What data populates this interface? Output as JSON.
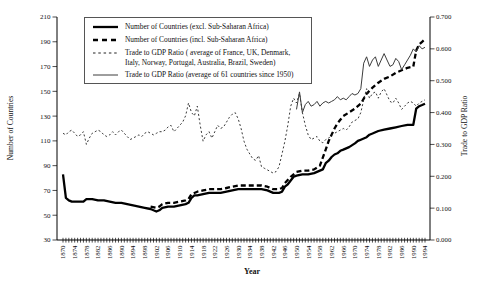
{
  "figure": {
    "kind": "dual-axis line chart",
    "background": "#ffffff",
    "line_color": "#000000"
  },
  "chart_data": {
    "type": "line",
    "title": "",
    "xlabel": "Year",
    "ylabel_left": "Number of Countries",
    "ylabel_right": "Trade to GDP Ratio",
    "grid": false,
    "legend_position": "top-left-inside",
    "x_range": [
      1870,
      1994
    ],
    "ylim_left": [
      30,
      210
    ],
    "ylim_right": [
      0.0,
      0.7
    ],
    "y_ticks_left": [
      30,
      50,
      70,
      90,
      110,
      130,
      150,
      170,
      190,
      210
    ],
    "y_ticks_right": [
      "0.000",
      "0.100",
      "0.200",
      "0.300",
      "0.400",
      "0.500",
      "0.600",
      "0.700"
    ],
    "x_ticks": [
      1870,
      1874,
      1878,
      1882,
      1886,
      1890,
      1894,
      1898,
      1902,
      1906,
      1910,
      1914,
      1918,
      1922,
      1926,
      1930,
      1934,
      1938,
      1942,
      1946,
      1950,
      1954,
      1958,
      1962,
      1966,
      1970,
      1974,
      1978,
      1982,
      1986,
      1990,
      1994
    ],
    "x_minor_tick_step": 1,
    "series": [
      {
        "id": "countries-excl-ssa",
        "name": "Number of Countries (excl. Sub-Saharan Africa)",
        "axis": "left",
        "style": "thick-solid",
        "color": "#000000",
        "points": [
          [
            1870,
            83
          ],
          [
            1871,
            64
          ],
          [
            1872,
            62
          ],
          [
            1873,
            61
          ],
          [
            1875,
            61
          ],
          [
            1877,
            61
          ],
          [
            1878,
            63
          ],
          [
            1880,
            63
          ],
          [
            1882,
            62
          ],
          [
            1884,
            62
          ],
          [
            1886,
            61
          ],
          [
            1888,
            60
          ],
          [
            1890,
            60
          ],
          [
            1892,
            59
          ],
          [
            1894,
            58
          ],
          [
            1896,
            57
          ],
          [
            1898,
            56
          ],
          [
            1900,
            55
          ],
          [
            1901,
            54
          ],
          [
            1902,
            53
          ],
          [
            1903,
            54
          ],
          [
            1904,
            56
          ],
          [
            1906,
            57
          ],
          [
            1908,
            57
          ],
          [
            1910,
            58
          ],
          [
            1912,
            59
          ],
          [
            1913,
            60
          ],
          [
            1914,
            64
          ],
          [
            1915,
            66
          ],
          [
            1916,
            66
          ],
          [
            1918,
            67
          ],
          [
            1920,
            68
          ],
          [
            1922,
            68
          ],
          [
            1924,
            68
          ],
          [
            1926,
            69
          ],
          [
            1928,
            70
          ],
          [
            1930,
            71
          ],
          [
            1934,
            71
          ],
          [
            1938,
            71
          ],
          [
            1940,
            70
          ],
          [
            1942,
            68
          ],
          [
            1944,
            68
          ],
          [
            1945,
            69
          ],
          [
            1946,
            73
          ],
          [
            1947,
            75
          ],
          [
            1948,
            78
          ],
          [
            1949,
            81
          ],
          [
            1950,
            82
          ],
          [
            1952,
            83
          ],
          [
            1954,
            83
          ],
          [
            1956,
            84
          ],
          [
            1958,
            86
          ],
          [
            1959,
            87
          ],
          [
            1960,
            92
          ],
          [
            1961,
            94
          ],
          [
            1962,
            97
          ],
          [
            1963,
            99
          ],
          [
            1964,
            100
          ],
          [
            1965,
            102
          ],
          [
            1966,
            103
          ],
          [
            1968,
            105
          ],
          [
            1970,
            108
          ],
          [
            1971,
            110
          ],
          [
            1972,
            111
          ],
          [
            1974,
            113
          ],
          [
            1975,
            115
          ],
          [
            1976,
            116
          ],
          [
            1978,
            118
          ],
          [
            1980,
            119
          ],
          [
            1982,
            120
          ],
          [
            1984,
            121
          ],
          [
            1986,
            122
          ],
          [
            1988,
            123
          ],
          [
            1990,
            123
          ],
          [
            1991,
            136
          ],
          [
            1992,
            138
          ],
          [
            1993,
            139
          ],
          [
            1994,
            140
          ]
        ]
      },
      {
        "id": "countries-incl-ssa",
        "name": "Number of Countries (incl. Sub-Saharan Africa)",
        "axis": "left",
        "style": "thick-dashed",
        "color": "#000000",
        "points": [
          [
            1900,
            57
          ],
          [
            1902,
            56
          ],
          [
            1903,
            57
          ],
          [
            1904,
            59
          ],
          [
            1906,
            60
          ],
          [
            1908,
            60
          ],
          [
            1910,
            61
          ],
          [
            1912,
            62
          ],
          [
            1913,
            63
          ],
          [
            1914,
            67
          ],
          [
            1916,
            69
          ],
          [
            1918,
            70
          ],
          [
            1920,
            71
          ],
          [
            1924,
            71
          ],
          [
            1926,
            72
          ],
          [
            1928,
            73
          ],
          [
            1930,
            74
          ],
          [
            1934,
            74
          ],
          [
            1938,
            74
          ],
          [
            1940,
            73
          ],
          [
            1942,
            71
          ],
          [
            1944,
            71
          ],
          [
            1945,
            72
          ],
          [
            1946,
            76
          ],
          [
            1948,
            81
          ],
          [
            1950,
            85
          ],
          [
            1952,
            86
          ],
          [
            1954,
            86
          ],
          [
            1956,
            87
          ],
          [
            1958,
            90
          ],
          [
            1960,
            103
          ],
          [
            1961,
            110
          ],
          [
            1962,
            115
          ],
          [
            1963,
            120
          ],
          [
            1964,
            124
          ],
          [
            1965,
            127
          ],
          [
            1966,
            130
          ],
          [
            1968,
            133
          ],
          [
            1970,
            136
          ],
          [
            1972,
            140
          ],
          [
            1974,
            148
          ],
          [
            1976,
            153
          ],
          [
            1978,
            157
          ],
          [
            1980,
            160
          ],
          [
            1982,
            162
          ],
          [
            1984,
            165
          ],
          [
            1986,
            167
          ],
          [
            1988,
            169
          ],
          [
            1990,
            170
          ],
          [
            1991,
            183
          ],
          [
            1992,
            188
          ],
          [
            1993,
            190
          ],
          [
            1994,
            192
          ]
        ]
      },
      {
        "id": "trade-gdp-9-countries",
        "name": "Trade to GDP Ratio ( average of France, UK, Denmark, Italy, Norway, Portugal, Australia, Brazil, Sweden)",
        "axis": "right",
        "style": "dotted",
        "color": "#222222",
        "x_start": 1870,
        "values": [
          0.335,
          0.33,
          0.34,
          0.345,
          0.335,
          0.325,
          0.33,
          0.34,
          0.3,
          0.32,
          0.335,
          0.34,
          0.345,
          0.34,
          0.33,
          0.325,
          0.33,
          0.34,
          0.33,
          0.34,
          0.345,
          0.335,
          0.325,
          0.315,
          0.32,
          0.325,
          0.33,
          0.325,
          0.335,
          0.34,
          0.335,
          0.33,
          0.335,
          0.34,
          0.34,
          0.345,
          0.355,
          0.36,
          0.34,
          0.35,
          0.36,
          0.37,
          0.39,
          0.43,
          0.4,
          0.39,
          0.42,
          0.36,
          0.31,
          0.33,
          0.34,
          0.32,
          0.34,
          0.36,
          0.35,
          0.355,
          0.37,
          0.385,
          0.395,
          0.4,
          0.38,
          0.35,
          0.31,
          0.285,
          0.27,
          0.255,
          0.25,
          0.265,
          0.23,
          0.225,
          0.22,
          0.215,
          0.21,
          0.215,
          0.23,
          0.27,
          0.31,
          0.36,
          0.42,
          0.445,
          0.43,
          0.46,
          0.4,
          0.36,
          0.33,
          0.315,
          0.32,
          0.325,
          0.31,
          0.305,
          0.315,
          0.32,
          0.33,
          0.335,
          0.34,
          0.345,
          0.35,
          0.345,
          0.355,
          0.37,
          0.375,
          0.38,
          0.4,
          0.44,
          0.475,
          0.445,
          0.46,
          0.465,
          0.445,
          0.465,
          0.475,
          0.455,
          0.435,
          0.43,
          0.445,
          0.43,
          0.41,
          0.42,
          0.43,
          0.435,
          0.43,
          0.42,
          0.43,
          0.435,
          0.44
        ]
      },
      {
        "id": "trade-gdp-61-countries",
        "name": "Trade to GDP Ratio (average of 61 countries since 1950)",
        "axis": "right",
        "style": "thin-solid",
        "color": "#3c3c3c",
        "x_start": 1950,
        "values": [
          0.41,
          0.465,
          0.4,
          0.425,
          0.435,
          0.42,
          0.425,
          0.435,
          0.42,
          0.43,
          0.435,
          0.43,
          0.435,
          0.44,
          0.45,
          0.44,
          0.445,
          0.44,
          0.45,
          0.46,
          0.455,
          0.46,
          0.475,
          0.555,
          0.575,
          0.545,
          0.565,
          0.575,
          0.545,
          0.565,
          0.585,
          0.565,
          0.545,
          0.55,
          0.57,
          0.56,
          0.535,
          0.55,
          0.565,
          0.58,
          0.6,
          0.59,
          0.61,
          0.6,
          0.605
        ]
      }
    ]
  }
}
